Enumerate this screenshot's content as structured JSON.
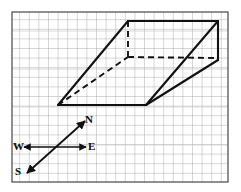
{
  "figure": {
    "canvas": {
      "width": 241,
      "height": 192,
      "background": "#ffffff"
    },
    "paper": {
      "name": "graph-paper",
      "border_color": "#4a4a4a",
      "grid_color": "#8c8c90",
      "grid_color_light": "#b9b9bd",
      "grid_spacing": 9.6,
      "bounds": {
        "x": 12,
        "y": 12,
        "width": 216,
        "height": 170
      }
    },
    "solid": {
      "stroke_color": "#111111",
      "stroke_width": 2,
      "dash_pattern": "6 4",
      "vertices": {
        "front_bottom_left": {
          "x": 58,
          "y": 105
        },
        "front_bottom_right": {
          "x": 146,
          "y": 105
        },
        "front_top_left": {
          "x": 128,
          "y": 21
        },
        "back_top_right": {
          "x": 218,
          "y": 21
        },
        "hidden_inner": {
          "x": 128,
          "y": 57
        },
        "right_mid": {
          "x": 218,
          "y": 60
        }
      },
      "solid_edges": [
        {
          "name": "bottom-front-edge",
          "from": "front_bottom_left",
          "to": "front_bottom_right"
        },
        {
          "name": "left-rising-edge",
          "from": "front_bottom_left",
          "to": "front_top_left"
        },
        {
          "name": "top-ridge-edge",
          "from": "front_top_left",
          "to": "back_top_right"
        },
        {
          "name": "right-rising-edge",
          "from": "front_bottom_right",
          "to": "back_top_right"
        },
        {
          "name": "right-lower-slope-edge",
          "from": "front_bottom_right",
          "to": "right_mid"
        },
        {
          "name": "right-vertical-edge",
          "from": "back_top_right",
          "to": "right_mid"
        }
      ],
      "hidden_edges": [
        {
          "name": "hidden-vertical-edge",
          "from": "front_top_left",
          "to": "hidden_inner"
        },
        {
          "name": "hidden-diagonal-edge",
          "from": "front_bottom_left",
          "to": "hidden_inner"
        },
        {
          "name": "hidden-horizontal-edge",
          "from": "hidden_inner",
          "to": "right_mid"
        }
      ]
    },
    "compass": {
      "name": "compass-rose",
      "stroke_color": "#111111",
      "stroke_width": 1.6,
      "west_east_axis": {
        "name": "west-east-arrow",
        "from": {
          "x": 24,
          "y": 147
        },
        "to": {
          "x": 86,
          "y": 147
        },
        "double_headed": true
      },
      "south_north_axis": {
        "name": "south-north-arrow",
        "from": {
          "x": 27,
          "y": 173
        },
        "to": {
          "x": 85,
          "y": 121
        },
        "double_headed": true
      },
      "labels": {
        "north": "N",
        "east": "E",
        "west": "W",
        "south": "S"
      }
    }
  }
}
